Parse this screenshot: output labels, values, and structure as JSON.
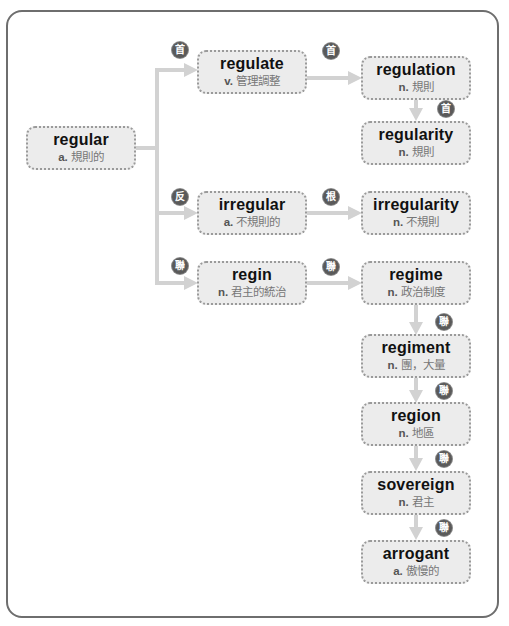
{
  "diagram": {
    "nodes": {
      "regular": {
        "word": "regular",
        "pos": "a.",
        "meaning": "規則的"
      },
      "regulate": {
        "word": "regulate",
        "pos": "v.",
        "meaning": "管理調整"
      },
      "regulation": {
        "word": "regulation",
        "pos": "n.",
        "meaning": "規則"
      },
      "regularity": {
        "word": "regularity",
        "pos": "n.",
        "meaning": "規則"
      },
      "irregular": {
        "word": "irregular",
        "pos": "a.",
        "meaning": "不規則的"
      },
      "irregularity": {
        "word": "irregularity",
        "pos": "n.",
        "meaning": "不規則"
      },
      "regin": {
        "word": "regin",
        "pos": "n.",
        "meaning": "君主的統治"
      },
      "regime": {
        "word": "regime",
        "pos": "n.",
        "meaning": "政治制度"
      },
      "regiment": {
        "word": "regiment",
        "pos": "n.",
        "meaning": "團，大量"
      },
      "region": {
        "word": "region",
        "pos": "n.",
        "meaning": "地區"
      },
      "sovereign": {
        "word": "sovereign",
        "pos": "n.",
        "meaning": "君主"
      },
      "arrogant": {
        "word": "arrogant",
        "pos": "a.",
        "meaning": "傲慢的"
      }
    },
    "badges": {
      "regular_to_regulate": "首",
      "regulate_to_regulation": "首",
      "regulation_to_regularity": "首",
      "regular_to_irregular": "反",
      "irregular_to_irregularity": "根",
      "regular_to_regin": "聯",
      "regin_to_regime": "聯",
      "regime_to_regiment": "聯",
      "regiment_to_region": "聯",
      "region_to_sovereign": "聯",
      "sovereign_to_arrogant": "聯"
    },
    "edges": [
      {
        "from": "regular",
        "to": "regulate",
        "label": "首"
      },
      {
        "from": "regulate",
        "to": "regulation",
        "label": "首"
      },
      {
        "from": "regulation",
        "to": "regularity",
        "label": "首"
      },
      {
        "from": "regular",
        "to": "irregular",
        "label": "反"
      },
      {
        "from": "irregular",
        "to": "irregularity",
        "label": "根"
      },
      {
        "from": "regular",
        "to": "regin",
        "label": "聯"
      },
      {
        "from": "regin",
        "to": "regime",
        "label": "聯"
      },
      {
        "from": "regime",
        "to": "regiment",
        "label": "聯"
      },
      {
        "from": "regiment",
        "to": "region",
        "label": "聯"
      },
      {
        "from": "region",
        "to": "sovereign",
        "label": "聯"
      },
      {
        "from": "sovereign",
        "to": "arrogant",
        "label": "聯"
      }
    ],
    "colors": {
      "node_fill": "#ececec",
      "node_border": "#9a9a9a",
      "connector": "#d2d2d2",
      "badge": "#5a5a5a",
      "frame": "#6e6e6e"
    }
  }
}
